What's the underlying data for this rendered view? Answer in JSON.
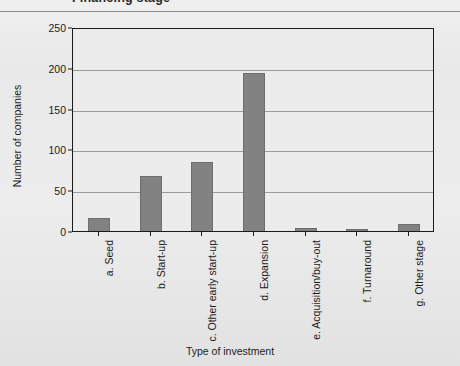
{
  "title": "Financing stage",
  "chart_data": {
    "type": "bar",
    "title": "Financing stage",
    "xlabel": "Type of investment",
    "ylabel": "Number of companies",
    "categories": [
      "a. Seed",
      "b. Start-up",
      "c. Other early start-up",
      "d. Expansion",
      "e. Acquisition/buy-out",
      "f. Turnaround",
      "g. Other stage"
    ],
    "values": [
      16,
      68,
      85,
      194,
      4,
      3,
      8
    ],
    "ylim": [
      0,
      250
    ],
    "yticks": [
      0,
      50,
      100,
      150,
      200,
      250
    ],
    "grid": true,
    "legend": null,
    "bar_color": "#828282",
    "frame_color": "#1a1a1a",
    "background_color": "#e9e9e9"
  }
}
